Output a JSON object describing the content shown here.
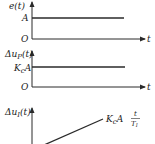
{
  "diagram": {
    "colors": {
      "line": "#2a2a2a",
      "text": "#222222",
      "background": "#ffffff"
    },
    "panels": [
      {
        "id": "error-step",
        "y_label": "e(t)",
        "origin_label": "O",
        "x_label": "t",
        "level_label": "A",
        "shape": "step"
      },
      {
        "id": "proportional-response",
        "y_label_prefix": "Δu",
        "y_label_sub": "P",
        "y_label_suffix": "(t)",
        "origin_label": "O",
        "x_label": "t",
        "level_label_main": "K",
        "level_label_sub": "c",
        "level_label_tail": "A",
        "shape": "step"
      },
      {
        "id": "integral-response",
        "y_label_prefix": "Δu",
        "y_label_sub": "I",
        "y_label_suffix": "(t)",
        "curve_label_main": "K",
        "curve_label_sub": "c",
        "curve_label_tail": "A",
        "curve_label_num": "t",
        "curve_label_den_main": "T",
        "curve_label_den_sub": "I",
        "shape": "ramp"
      }
    ]
  }
}
